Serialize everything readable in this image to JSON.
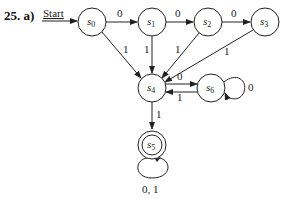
{
  "figure": {
    "label": "25. a)",
    "start_label": "Start",
    "states": [
      {
        "id": "s0",
        "name": "s",
        "sub": "0",
        "x": 92,
        "y": 22,
        "accepting": false
      },
      {
        "id": "s1",
        "name": "s",
        "sub": "1",
        "x": 152,
        "y": 22,
        "accepting": false
      },
      {
        "id": "s2",
        "name": "s",
        "sub": "2",
        "x": 208,
        "y": 22,
        "accepting": false
      },
      {
        "id": "s3",
        "name": "s",
        "sub": "3",
        "x": 265,
        "y": 22,
        "accepting": false
      },
      {
        "id": "s4",
        "name": "s",
        "sub": "4",
        "x": 152,
        "y": 88,
        "accepting": false
      },
      {
        "id": "s6",
        "name": "s",
        "sub": "6",
        "x": 211,
        "y": 88,
        "accepting": false
      },
      {
        "id": "s5",
        "name": "s",
        "sub": "5",
        "x": 152,
        "y": 145,
        "accepting": true
      }
    ],
    "transitions": [
      {
        "from": "s0",
        "to": "s1",
        "label": "0"
      },
      {
        "from": "s1",
        "to": "s2",
        "label": "0"
      },
      {
        "from": "s2",
        "to": "s3",
        "label": "0"
      },
      {
        "from": "s0",
        "to": "s4",
        "label": "1"
      },
      {
        "from": "s1",
        "to": "s4",
        "label": "1"
      },
      {
        "from": "s2",
        "to": "s4",
        "label": "1"
      },
      {
        "from": "s3",
        "to": "s4",
        "label": "1"
      },
      {
        "from": "s4",
        "to": "s6",
        "label": "0"
      },
      {
        "from": "s6",
        "to": "s4",
        "label": "1"
      },
      {
        "from": "s6",
        "to": "s6",
        "label": "0"
      },
      {
        "from": "s4",
        "to": "s5",
        "label": "1"
      },
      {
        "from": "s5",
        "to": "s5",
        "label": "0, 1"
      }
    ]
  }
}
